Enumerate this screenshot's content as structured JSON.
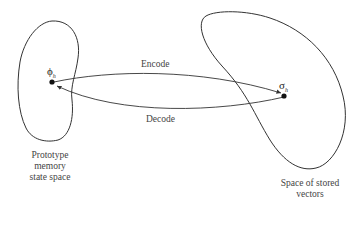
{
  "diagram": {
    "left_space": {
      "label_lines": [
        "Prototype",
        "memory",
        "state space"
      ],
      "point_symbol": "ϕ",
      "point_subscript": "h"
    },
    "right_space": {
      "label_lines": [
        "Space of stored",
        "vectors"
      ],
      "point_symbol": "σ",
      "point_subscript": "h"
    },
    "arrows": {
      "encode_label": "Encode",
      "decode_label": "Decode"
    },
    "colors": {
      "stroke": "#333333",
      "text": "#444444",
      "background": "#ffffff"
    }
  }
}
